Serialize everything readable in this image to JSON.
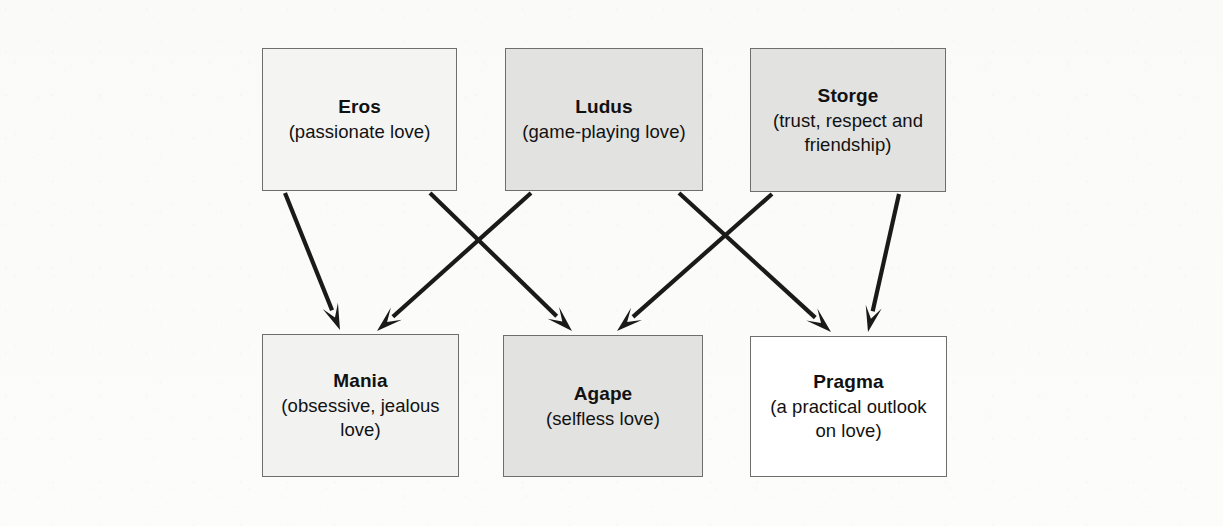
{
  "diagram": {
    "canvas": {
      "width": 1223,
      "height": 526
    },
    "background_color": "#fbfbfa",
    "border_color": "#6e6e6e",
    "arrow_color": "#1a1a1a",
    "nodes": [
      {
        "id": "eros",
        "title": "Eros",
        "subtitle": "(passionate love)",
        "fill": "#f4f4f2",
        "x": 262,
        "y": 48,
        "width": 195,
        "height": 143
      },
      {
        "id": "ludus",
        "title": "Ludus",
        "subtitle": "(game-playing love)",
        "fill": "#e2e2e0",
        "x": 505,
        "y": 48,
        "width": 198,
        "height": 143
      },
      {
        "id": "storge",
        "title": "Storge",
        "subtitle": "(trust, respect and\nfriendship)",
        "fill": "#e2e2e0",
        "x": 750,
        "y": 48,
        "width": 196,
        "height": 144
      },
      {
        "id": "mania",
        "title": "Mania",
        "subtitle": "(obsessive, jealous\nlove)",
        "fill": "#f2f2f0",
        "x": 262,
        "y": 334,
        "width": 197,
        "height": 143
      },
      {
        "id": "agape",
        "title": "Agape",
        "subtitle": "(selfless love)",
        "fill": "#e2e2e0",
        "x": 503,
        "y": 335,
        "width": 200,
        "height": 142
      },
      {
        "id": "pragma",
        "title": "Pragma",
        "subtitle": "(a practical outlook\non love)",
        "fill": "#ffffff",
        "x": 750,
        "y": 336,
        "width": 197,
        "height": 141
      }
    ],
    "edges": [
      {
        "id": "eros-to-mania",
        "from": "eros",
        "to": "mania",
        "x1": 285,
        "y1": 193,
        "x2": 340,
        "y2": 330
      },
      {
        "id": "eros-to-agape",
        "from": "eros",
        "to": "agape",
        "x1": 430,
        "y1": 193,
        "x2": 572,
        "y2": 331
      },
      {
        "id": "ludus-to-mania",
        "from": "ludus",
        "to": "mania",
        "x1": 531,
        "y1": 193,
        "x2": 377,
        "y2": 331
      },
      {
        "id": "ludus-to-pragma",
        "from": "ludus",
        "to": "pragma",
        "x1": 679,
        "y1": 193,
        "x2": 831,
        "y2": 332
      },
      {
        "id": "storge-to-agape",
        "from": "storge",
        "to": "agape",
        "x1": 772,
        "y1": 194,
        "x2": 617,
        "y2": 331
      },
      {
        "id": "storge-to-pragma",
        "from": "storge",
        "to": "pragma",
        "x1": 899,
        "y1": 194,
        "x2": 868,
        "y2": 332
      }
    ]
  }
}
